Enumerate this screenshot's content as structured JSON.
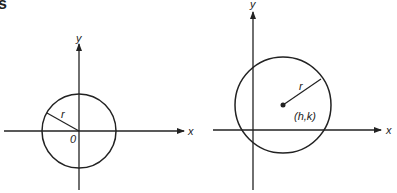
{
  "header": {
    "partial_text": "s"
  },
  "left_diagram": {
    "x_label": "x",
    "y_label": "y",
    "radius_label": "r",
    "origin_label": "0",
    "center": [
      79,
      131
    ],
    "radius": 37
  },
  "right_diagram": {
    "x_label": "x",
    "y_label": "y",
    "radius_label": "r",
    "center_label": "(h,k)",
    "center": [
      283,
      105
    ],
    "radius": 48
  },
  "colors": {
    "stroke": "#222222",
    "background": "#ffffff"
  }
}
